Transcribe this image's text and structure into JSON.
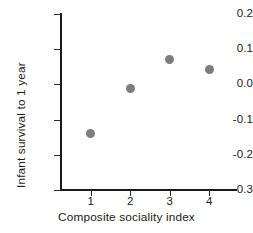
{
  "chart_data": {
    "type": "scatter",
    "title": "",
    "xlabel": "Composite sociality index",
    "ylabel": "Infant survival to 1 year",
    "x": [
      1,
      2,
      3,
      4
    ],
    "values": [
      -0.14,
      -0.012,
      0.072,
      0.043
    ],
    "series": [
      {
        "name": "Infant survival to 1 year",
        "values": [
          -0.14,
          -0.012,
          0.072,
          0.043
        ]
      }
    ],
    "xlim": [
      0.25,
      4.7
    ],
    "ylim": [
      -0.3,
      0.2
    ],
    "xticks": [
      1,
      2,
      3,
      4
    ],
    "xtick_labels": [
      "1",
      "2",
      "3",
      "4"
    ],
    "yticks": [
      0.2,
      0.1,
      0.0,
      -0.1,
      -0.2,
      -0.3
    ],
    "ytick_labels": [
      "0.2",
      "0.1",
      "0.0",
      "-0.1",
      "-0.2",
      "-0.3"
    ],
    "grid": false,
    "legend": "none",
    "marker_color": "#7d7d7d",
    "axis_color": "#1a1a1a",
    "background_color": "#ffffff",
    "marker_shape": "circle"
  }
}
